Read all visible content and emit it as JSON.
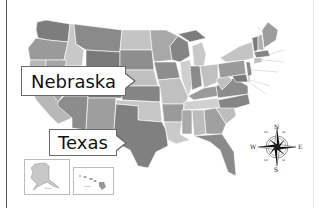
{
  "map": {
    "title": "United States Map",
    "style": "grayscale political map",
    "callouts": [
      {
        "label": "Nebraska",
        "points_to": "Nebraska"
      },
      {
        "label": "Texas",
        "points_to": "Texas"
      }
    ],
    "insets": [
      {
        "name": "Alaska",
        "label": "Alaska"
      },
      {
        "name": "Hawaii",
        "label": "Hawaii"
      }
    ],
    "compass": {
      "cardinal": {
        "north": "N",
        "south": "S",
        "east": "E",
        "west": "W"
      },
      "intercardinal": {
        "ne": "NE",
        "nw": "NW",
        "se": "SE",
        "sw": "SW"
      }
    },
    "colors": {
      "dark": "#7a7a7a",
      "medium": "#959595",
      "light": "#b4b4b4",
      "lightest": "#cfcfcf",
      "border": "#ffffff",
      "callout_border": "#6a6a6a"
    }
  }
}
